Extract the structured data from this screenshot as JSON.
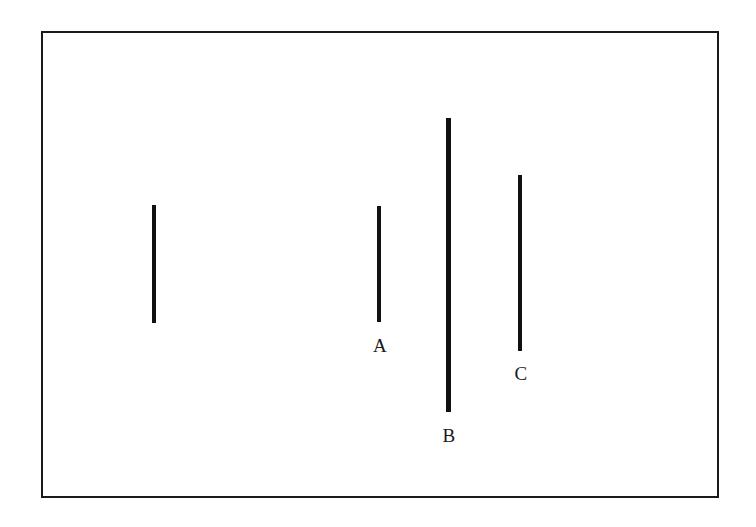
{
  "figure": {
    "background_color": "#ffffff",
    "frame": {
      "stroke_color": "#1a1a1a",
      "stroke_width_px": 2.5,
      "x": 41,
      "y": 31,
      "width": 678,
      "height": 467
    },
    "line_color": "#111111",
    "segments": [
      {
        "label": "",
        "name": "reference-line",
        "x": 152,
        "y_top": 205,
        "y_bottom": 323,
        "length_px": 118,
        "thickness_px": 4,
        "label_x": 0,
        "label_y": 0
      },
      {
        "label": "A",
        "name": "line-a",
        "x": 377,
        "y_top": 206,
        "y_bottom": 322,
        "length_px": 116,
        "thickness_px": 4,
        "label_x": 372,
        "label_y": 336
      },
      {
        "label": "B",
        "name": "line-b",
        "x": 446,
        "y_top": 118,
        "y_bottom": 412,
        "length_px": 294,
        "thickness_px": 5,
        "label_x": 441,
        "label_y": 426
      },
      {
        "label": "C",
        "name": "line-c",
        "x": 518,
        "y_top": 175,
        "y_bottom": 351,
        "length_px": 176,
        "thickness_px": 4,
        "label_x": 513,
        "label_y": 364
      }
    ]
  },
  "chart_data": {
    "type": "bar",
    "title": "",
    "xlabel": "",
    "ylabel": "",
    "categories": [
      "",
      "A",
      "B",
      "C"
    ],
    "values": [
      118,
      116,
      294,
      176
    ],
    "note": "Vertical line segments of differing lengths; the leftmost segment is unlabeled and serves as the reference/standard line."
  }
}
